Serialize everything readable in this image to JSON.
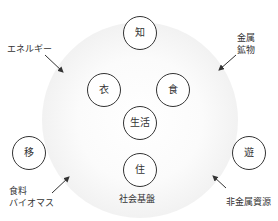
{
  "diagram": {
    "outer_circle": {
      "label": "社会基盤"
    },
    "center": {
      "label": "生活"
    },
    "nodes": [
      {
        "id": "chi",
        "label": "知"
      },
      {
        "id": "i",
        "label": "衣"
      },
      {
        "id": "shoku",
        "label": "食"
      },
      {
        "id": "i_move",
        "label": "移"
      },
      {
        "id": "yu",
        "label": "遊"
      },
      {
        "id": "ju",
        "label": "住"
      }
    ],
    "inputs": [
      {
        "id": "energy",
        "label": "エネルギー"
      },
      {
        "id": "metal",
        "line1": "金属",
        "line2": "鉱物"
      },
      {
        "id": "food",
        "line1": "食料",
        "line2": "バイオマス"
      },
      {
        "id": "nonmetal",
        "label": "非金属資源"
      }
    ]
  }
}
